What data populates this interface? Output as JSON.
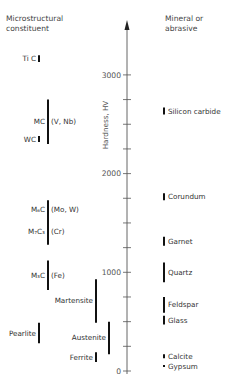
{
  "chart_data": {
    "type": "range-bar",
    "title": "",
    "ylabel": "Hardness, HV",
    "ylim": [
      0,
      3500
    ],
    "yticks_major": [
      0,
      1000,
      2000,
      3000
    ],
    "ytick_labels": [
      "0",
      "1000",
      "2000",
      "3000"
    ],
    "ytick_minor_step": 250,
    "left_header": [
      "Microstructural",
      "constituent"
    ],
    "right_header": [
      "Mineral or",
      "abrasive"
    ],
    "left_series": [
      {
        "label": "Ti C",
        "extra": "",
        "min": 3130,
        "max": 3200,
        "column": "inner"
      },
      {
        "label": "MC",
        "extra": "(V, Nb)",
        "min": 2300,
        "max": 2750,
        "column": "outer"
      },
      {
        "label": "WC",
        "extra": "",
        "min": 2320,
        "max": 2380,
        "column": "inner"
      },
      {
        "label": "M₆C",
        "extra": "(Mo, W)",
        "min": 1550,
        "max": 1730,
        "column": "outer"
      },
      {
        "label": "M₇C₃",
        "extra": "(Cr)",
        "min": 1280,
        "max": 1550,
        "column": "outer"
      },
      {
        "label": "M₃C",
        "extra": "(Fe)",
        "min": 820,
        "max": 1120,
        "column": "outer"
      },
      {
        "label": "Martensite",
        "extra": "",
        "min": 490,
        "max": 930,
        "column": "mid"
      },
      {
        "label": "Pearlite",
        "extra": "",
        "min": 280,
        "max": 490,
        "column": "inner"
      },
      {
        "label": "Austenite",
        "extra": "",
        "min": 170,
        "max": 500,
        "column": "right"
      },
      {
        "label": "Ferrite",
        "extra": "",
        "min": 90,
        "max": 190,
        "column": "mid"
      }
    ],
    "right_series": [
      {
        "label": "Silicon carbide",
        "min": 2600,
        "max": 2670
      },
      {
        "label": "Corundum",
        "min": 1730,
        "max": 1800
      },
      {
        "label": "Garnet",
        "min": 1270,
        "max": 1360
      },
      {
        "label": "Quartz",
        "min": 900,
        "max": 1100
      },
      {
        "label": "Feldspar",
        "min": 590,
        "max": 750
      },
      {
        "label": "Glass",
        "min": 470,
        "max": 560
      },
      {
        "label": "Calcite",
        "min": 130,
        "max": 170
      },
      {
        "label": "Gypsum",
        "min": 40,
        "max": 60
      }
    ]
  }
}
